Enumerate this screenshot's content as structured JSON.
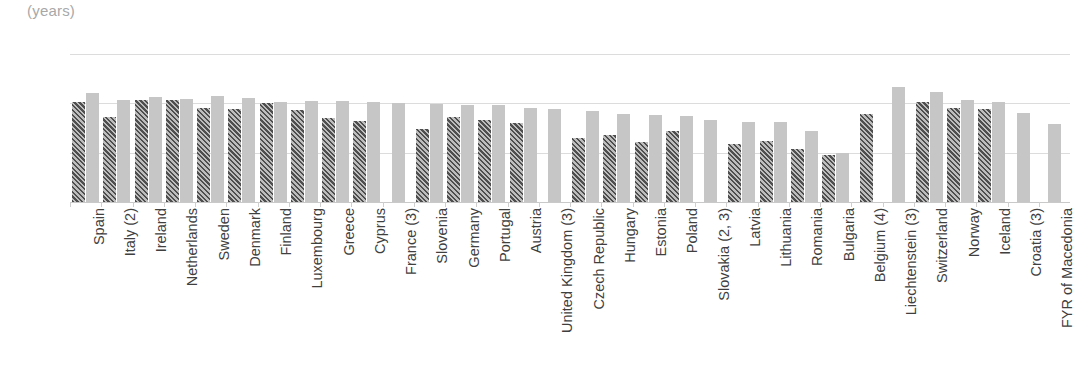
{
  "units_label": "(years)",
  "colors": {
    "series_a": "#4e4e4e",
    "series_b": "#c6c6c6",
    "gridline": "#dcdcdc",
    "axis_text": "#3f3f3f",
    "units_text": "#a8a8a8"
  },
  "chart_data": {
    "type": "bar",
    "title": "",
    "subtitle": "",
    "xlabel": "",
    "ylabel": "(years)",
    "ylim": [
      20,
      35
    ],
    "yticks": [
      20,
      25,
      30,
      35
    ],
    "ytick_labels": [
      "20",
      "25",
      "30",
      "35"
    ],
    "grid": true,
    "legend": "none",
    "orientation": "vertical",
    "grouped": true,
    "categories": [
      "Spain",
      "Italy (2)",
      "Ireland",
      "Netherlands",
      "Sweden",
      "Denmark",
      "Finland",
      "Luxembourg",
      "Greece",
      "Cyprus",
      "France (3)",
      "Slovenia",
      "Germany",
      "Portugal",
      "Austria",
      "United Kingdom (3)",
      "Czech Republic",
      "Hungary",
      "Estonia",
      "Poland",
      "Slovakia (2, 3)",
      "Latvia",
      "Lithuania",
      "Romania",
      "Bulgaria",
      "Belgium (4)",
      "Liechtenstein (3)",
      "Switzerland",
      "Norway",
      "Iceland",
      "Croatia (3)",
      "FYR of Macedonia"
    ],
    "series": [
      {
        "name": "series-a",
        "style": "hatched-dark",
        "values": [
          30.1,
          28.6,
          30.3,
          30.3,
          29.5,
          29.4,
          30.0,
          29.3,
          28.5,
          28.2,
          null,
          27.4,
          28.6,
          28.3,
          28.0,
          null,
          26.5,
          26.8,
          26.1,
          27.2,
          null,
          25.9,
          26.2,
          25.4,
          24.8,
          28.9,
          null,
          30.1,
          29.5,
          29.4,
          null,
          null
        ]
      },
      {
        "name": "series-b",
        "style": "solid-light",
        "values": [
          31.0,
          30.3,
          30.6,
          30.4,
          30.7,
          30.5,
          30.1,
          30.2,
          30.2,
          30.1,
          30.0,
          29.9,
          29.8,
          29.8,
          29.5,
          29.4,
          29.2,
          28.9,
          28.8,
          28.7,
          28.3,
          28.1,
          28.1,
          27.2,
          25.0,
          null,
          31.7,
          31.1,
          30.3,
          30.1,
          29.0,
          27.9
        ]
      }
    ]
  }
}
